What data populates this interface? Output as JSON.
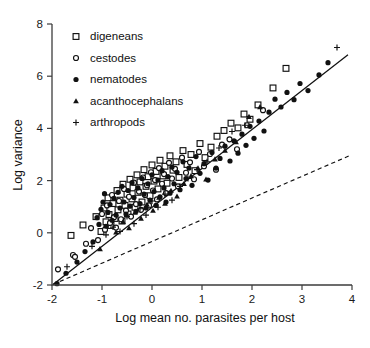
{
  "chart_data": {
    "type": "scatter",
    "title": "",
    "xlabel": "Log mean no. parasites per host",
    "ylabel": "Log variance",
    "xlim": [
      -2,
      4
    ],
    "ylim": [
      -2,
      8
    ],
    "xticks": [
      -2,
      -1,
      0,
      1,
      2,
      3,
      4
    ],
    "yticks": [
      -2,
      0,
      2,
      4,
      6,
      8
    ],
    "xtick_labels": [
      "-2",
      "-1",
      "0",
      "1",
      "2",
      "3",
      "4"
    ],
    "ytick_labels": [
      "-2",
      "0",
      "2",
      "4",
      "6",
      "8"
    ],
    "grid": false,
    "legend_position": "top-left",
    "series": [
      {
        "name": "digeneans",
        "marker": "open-square",
        "color": "#111111",
        "points": [
          [
            -1.62,
            -0.1
          ],
          [
            -1.38,
            0.3
          ],
          [
            -1.12,
            0.62
          ],
          [
            -1.02,
            0.05
          ],
          [
            -0.96,
            0.95
          ],
          [
            -0.92,
            0.42
          ],
          [
            -0.88,
            1.34
          ],
          [
            -0.86,
            0.7
          ],
          [
            -0.82,
            0.28
          ],
          [
            -0.78,
            1.12
          ],
          [
            -0.74,
            0.55
          ],
          [
            -0.7,
            1.62
          ],
          [
            -0.68,
            0.88
          ],
          [
            -0.64,
            1.25
          ],
          [
            -0.6,
            0.45
          ],
          [
            -0.58,
            1.86
          ],
          [
            -0.54,
            1.05
          ],
          [
            -0.5,
            1.48
          ],
          [
            -0.48,
            0.72
          ],
          [
            -0.44,
            2.05
          ],
          [
            -0.4,
            1.3
          ],
          [
            -0.38,
            1.72
          ],
          [
            -0.34,
            0.98
          ],
          [
            -0.3,
            2.22
          ],
          [
            -0.28,
            1.55
          ],
          [
            -0.24,
            1.95
          ],
          [
            -0.2,
            1.18
          ],
          [
            -0.16,
            2.42
          ],
          [
            -0.12,
            1.78
          ],
          [
            -0.08,
            2.15
          ],
          [
            -0.04,
            1.42
          ],
          [
            0.0,
            2.6
          ],
          [
            0.04,
            1.98
          ],
          [
            0.08,
            2.35
          ],
          [
            0.12,
            1.68
          ],
          [
            0.16,
            2.78
          ],
          [
            0.22,
            2.18
          ],
          [
            0.26,
            2.55
          ],
          [
            0.3,
            1.9
          ],
          [
            0.36,
            2.95
          ],
          [
            0.42,
            2.4
          ],
          [
            0.48,
            2.72
          ],
          [
            0.54,
            2.12
          ],
          [
            0.62,
            3.15
          ],
          [
            0.7,
            2.62
          ],
          [
            0.78,
            3.0
          ],
          [
            0.86,
            2.38
          ],
          [
            0.96,
            3.42
          ],
          [
            1.06,
            2.88
          ],
          [
            1.18,
            3.28
          ],
          [
            1.3,
            3.7
          ],
          [
            1.44,
            3.92
          ],
          [
            1.58,
            4.2
          ],
          [
            1.72,
            4.02
          ],
          [
            1.84,
            4.55
          ],
          [
            1.96,
            4.35
          ],
          [
            2.12,
            4.9
          ],
          [
            2.42,
            5.55
          ],
          [
            2.68,
            6.3
          ]
        ]
      },
      {
        "name": "cestodes",
        "marker": "open-circle",
        "color": "#111111",
        "points": [
          [
            -1.88,
            -1.4
          ],
          [
            -1.58,
            -0.85
          ],
          [
            -1.54,
            -0.92
          ],
          [
            -1.32,
            -0.42
          ],
          [
            -1.22,
            0.18
          ],
          [
            -1.08,
            -0.28
          ],
          [
            -1.0,
            0.72
          ],
          [
            -0.94,
            0.12
          ],
          [
            -0.9,
            1.05
          ],
          [
            -0.84,
            0.38
          ],
          [
            -0.8,
            1.45
          ],
          [
            -0.76,
            0.6
          ],
          [
            -0.72,
            0.2
          ],
          [
            -0.66,
            1.22
          ],
          [
            -0.62,
            0.52
          ],
          [
            -0.56,
            1.68
          ],
          [
            -0.52,
            0.85
          ],
          [
            -0.46,
            1.38
          ],
          [
            -0.42,
            0.62
          ],
          [
            -0.36,
            1.92
          ],
          [
            -0.32,
            1.1
          ],
          [
            -0.26,
            1.58
          ],
          [
            -0.22,
            0.88
          ],
          [
            -0.18,
            2.12
          ],
          [
            -0.14,
            1.45
          ],
          [
            -0.1,
            1.82
          ],
          [
            -0.06,
            1.05
          ],
          [
            -0.02,
            2.32
          ],
          [
            0.02,
            1.62
          ],
          [
            0.06,
            2.02
          ],
          [
            0.1,
            1.28
          ],
          [
            0.14,
            2.48
          ],
          [
            0.2,
            1.88
          ],
          [
            0.24,
            2.25
          ],
          [
            0.28,
            1.52
          ],
          [
            0.34,
            2.68
          ],
          [
            0.4,
            2.08
          ],
          [
            0.46,
            2.45
          ],
          [
            0.52,
            1.78
          ],
          [
            0.6,
            2.88
          ],
          [
            0.68,
            2.3
          ],
          [
            0.76,
            2.7
          ],
          [
            0.84,
            2.05
          ],
          [
            0.94,
            3.1
          ],
          [
            1.04,
            2.55
          ],
          [
            1.16,
            3.02
          ],
          [
            1.28,
            2.42
          ],
          [
            1.4,
            3.38
          ],
          [
            1.55,
            3.58
          ],
          [
            1.7,
            3.2
          ],
          [
            1.9,
            4.12
          ],
          [
            2.22,
            4.7
          ]
        ]
      },
      {
        "name": "nematodes",
        "marker": "filled-circle",
        "color": "#111111",
        "points": [
          [
            -1.9,
            -1.95
          ],
          [
            -1.72,
            -1.55
          ],
          [
            -1.5,
            -1.12
          ],
          [
            -1.34,
            -0.72
          ],
          [
            -1.18,
            -0.35
          ],
          [
            -1.1,
            0.58
          ],
          [
            -1.06,
            0.32
          ],
          [
            -1.02,
            0.9
          ],
          [
            -0.98,
            1.18
          ],
          [
            -0.95,
            1.5
          ],
          [
            -0.92,
            0.25
          ],
          [
            -0.88,
            0.78
          ],
          [
            -0.84,
            1.08
          ],
          [
            -0.8,
            0.48
          ],
          [
            -0.76,
            1.32
          ],
          [
            -0.72,
            0.68
          ],
          [
            -0.68,
            1.55
          ],
          [
            -0.64,
            0.95
          ],
          [
            -0.6,
            1.78
          ],
          [
            -0.56,
            1.18
          ],
          [
            -0.52,
            0.72
          ],
          [
            -0.48,
            1.62
          ],
          [
            -0.44,
            1.02
          ],
          [
            -0.4,
            1.92
          ],
          [
            -0.36,
            1.35
          ],
          [
            -0.32,
            0.82
          ],
          [
            -0.28,
            1.72
          ],
          [
            -0.24,
            1.12
          ],
          [
            -0.2,
            2.08
          ],
          [
            -0.16,
            1.48
          ],
          [
            -0.12,
            0.95
          ],
          [
            -0.08,
            1.88
          ],
          [
            -0.04,
            1.25
          ],
          [
            0.0,
            2.22
          ],
          [
            0.04,
            1.58
          ],
          [
            0.08,
            1.05
          ],
          [
            0.12,
            2.02
          ],
          [
            0.16,
            1.38
          ],
          [
            0.2,
            2.38
          ],
          [
            0.24,
            1.72
          ],
          [
            0.28,
            1.18
          ],
          [
            0.32,
            2.15
          ],
          [
            0.36,
            1.52
          ],
          [
            0.4,
            2.52
          ],
          [
            0.44,
            1.88
          ],
          [
            0.5,
            2.32
          ],
          [
            0.56,
            1.65
          ],
          [
            0.62,
            2.72
          ],
          [
            0.68,
            2.08
          ],
          [
            0.74,
            2.48
          ],
          [
            0.8,
            1.82
          ],
          [
            0.88,
            2.92
          ],
          [
            0.96,
            2.28
          ],
          [
            1.04,
            2.65
          ],
          [
            1.12,
            2.02
          ],
          [
            1.2,
            3.08
          ],
          [
            1.28,
            2.48
          ],
          [
            1.36,
            2.85
          ],
          [
            1.46,
            3.32
          ],
          [
            1.56,
            2.75
          ],
          [
            1.64,
            3.52
          ],
          [
            1.72,
            3.05
          ],
          [
            1.8,
            3.78
          ],
          [
            1.88,
            3.35
          ],
          [
            1.96,
            4.08
          ],
          [
            2.04,
            3.62
          ],
          [
            2.14,
            4.28
          ],
          [
            2.24,
            3.9
          ],
          [
            2.34,
            4.62
          ],
          [
            2.46,
            5.12
          ],
          [
            2.58,
            4.82
          ],
          [
            2.7,
            5.38
          ],
          [
            2.84,
            5.1
          ],
          [
            2.96,
            5.72
          ],
          [
            3.12,
            5.45
          ],
          [
            3.34,
            6.05
          ],
          [
            3.52,
            6.52
          ]
        ]
      },
      {
        "name": "acanthocephalans",
        "marker": "filled-triangle",
        "color": "#111111",
        "points": [
          [
            -1.04,
            -0.62
          ],
          [
            -0.72,
            0.02
          ],
          [
            -0.58,
            0.42
          ],
          [
            -0.46,
            0.18
          ],
          [
            -0.34,
            0.78
          ],
          [
            -0.22,
            0.55
          ],
          [
            -0.1,
            1.08
          ],
          [
            0.02,
            0.85
          ],
          [
            0.14,
            1.35
          ],
          [
            0.26,
            1.12
          ],
          [
            0.38,
            1.62
          ],
          [
            0.5,
            1.4
          ],
          [
            0.64,
            1.88
          ],
          [
            0.78,
            2.18
          ],
          [
            0.92,
            2.48
          ],
          [
            1.08,
            2.05
          ],
          [
            1.26,
            2.82
          ],
          [
            1.46,
            3.15
          ],
          [
            1.68,
            3.48
          ],
          [
            1.94,
            4.45
          ],
          [
            2.16,
            4.82
          ]
        ]
      },
      {
        "name": "arthropods",
        "marker": "plus",
        "color": "#111111",
        "points": [
          [
            -1.7,
            -1.3
          ],
          [
            -1.2,
            -0.52
          ],
          [
            -0.92,
            -0.08
          ],
          [
            -0.78,
            0.22
          ],
          [
            -0.64,
            0.05
          ],
          [
            -0.5,
            0.62
          ],
          [
            -0.36,
            0.35
          ],
          [
            -0.24,
            0.92
          ],
          [
            -0.12,
            0.68
          ],
          [
            0.0,
            1.22
          ],
          [
            0.12,
            0.98
          ],
          [
            0.26,
            1.48
          ],
          [
            0.4,
            1.25
          ],
          [
            0.56,
            1.78
          ],
          [
            0.72,
            2.08
          ],
          [
            0.9,
            2.42
          ],
          [
            1.1,
            2.72
          ],
          [
            1.34,
            3.25
          ],
          [
            1.6,
            3.88
          ],
          [
            1.86,
            4.12
          ],
          [
            3.7,
            7.1
          ]
        ]
      }
    ],
    "lines": [
      {
        "name": "regression-line",
        "style": "solid",
        "x0": -1.98,
        "y0": -1.98,
        "x1": 3.92,
        "y1": 6.82
      },
      {
        "name": "reference-line",
        "style": "dashed",
        "x0": -1.98,
        "y0": -1.98,
        "x1": 3.98,
        "y1": 2.98
      }
    ]
  },
  "legend": {
    "items": [
      {
        "label": "digeneans",
        "marker": "open-square"
      },
      {
        "label": "cestodes",
        "marker": "open-circle"
      },
      {
        "label": "nematodes",
        "marker": "filled-circle"
      },
      {
        "label": "acanthocephalans",
        "marker": "filled-triangle"
      },
      {
        "label": "arthropods",
        "marker": "plus"
      }
    ]
  },
  "caption": {
    "text": ""
  }
}
